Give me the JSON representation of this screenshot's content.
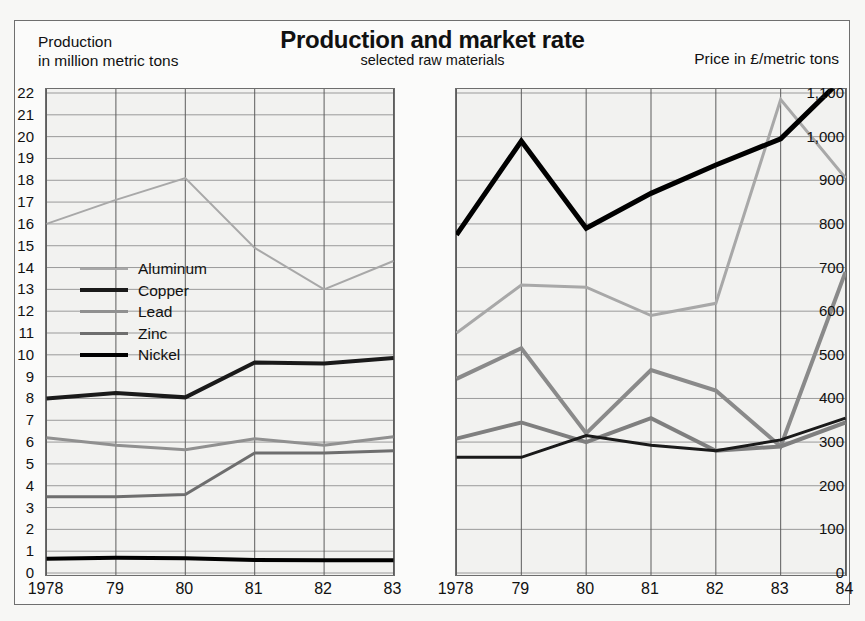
{
  "header": {
    "title": "Production and market rate",
    "subtitle": "selected raw materials",
    "left_caption_line1": "Production",
    "left_caption_line2": "in million metric tons",
    "right_caption": "Price in £/metric tons"
  },
  "legend": {
    "position": "inside-left-panel",
    "entries": [
      {
        "label": "Aluminum",
        "color": "#a8a8a8",
        "width": 2
      },
      {
        "label": "Copper",
        "color": "#1a1a1a",
        "width": 4
      },
      {
        "label": "Lead",
        "color": "#909090",
        "width": 3
      },
      {
        "label": "Zinc",
        "color": "#6e6e6e",
        "width": 3
      },
      {
        "label": "Nickel",
        "color": "#000000",
        "width": 4
      }
    ]
  },
  "chart_data": [
    {
      "id": "production",
      "type": "line",
      "title": "Production",
      "ylabel": "in million metric tons",
      "xlabel": "",
      "categories": [
        "1978",
        "79",
        "80",
        "81",
        "82",
        "83"
      ],
      "x_tick_labels": [
        "1978",
        "79",
        "80",
        "81",
        "82",
        "83"
      ],
      "ylim": [
        0,
        22
      ],
      "ytick_step": 1,
      "y_tick_labels": [
        "0",
        "1",
        "2",
        "3",
        "4",
        "5",
        "6",
        "7",
        "8",
        "9",
        "10",
        "11",
        "12",
        "13",
        "14",
        "15",
        "16",
        "17",
        "18",
        "19",
        "20",
        "21",
        "22"
      ],
      "grid": true,
      "series": [
        {
          "name": "Aluminum",
          "color": "#a8a8a8",
          "width": 2,
          "values": [
            16.0,
            17.1,
            18.1,
            14.9,
            13.0,
            14.3
          ]
        },
        {
          "name": "Copper",
          "color": "#1a1a1a",
          "width": 4,
          "values": [
            8.0,
            8.25,
            8.05,
            9.65,
            9.6,
            9.85
          ]
        },
        {
          "name": "Lead",
          "color": "#909090",
          "width": 3,
          "values": [
            6.2,
            5.85,
            5.65,
            6.15,
            5.85,
            6.25
          ]
        },
        {
          "name": "Zinc",
          "color": "#6e6e6e",
          "width": 3,
          "values": [
            3.5,
            3.5,
            3.6,
            5.5,
            5.5,
            5.6
          ]
        },
        {
          "name": "Nickel",
          "color": "#000000",
          "width": 4,
          "values": [
            0.65,
            0.7,
            0.68,
            0.6,
            0.58,
            0.58
          ]
        }
      ]
    },
    {
      "id": "market-rate",
      "type": "line",
      "title": "market rate",
      "ylabel": "Price in £/metric tons",
      "xlabel": "",
      "categories": [
        "1978",
        "79",
        "80",
        "81",
        "82",
        "83",
        "84"
      ],
      "x_tick_labels": [
        "1978",
        "79",
        "80",
        "81",
        "82",
        "83",
        "84"
      ],
      "ylim": [
        0,
        1100
      ],
      "ytick_step": 100,
      "y_tick_labels": [
        "0",
        "100",
        "200",
        "300",
        "400",
        "500",
        "600",
        "700",
        "800",
        "900",
        "1,000",
        "1,100"
      ],
      "grid": true,
      "series": [
        {
          "name": "Aluminum",
          "color": "#a8a8a8",
          "width": 3,
          "values": [
            550,
            660,
            655,
            590,
            618,
            1085,
            905
          ]
        },
        {
          "name": "Copper",
          "color": "#8a8a8a",
          "width": 4,
          "values": [
            445,
            515,
            320,
            465,
            418,
            290,
            690
          ]
        },
        {
          "name": "Lead",
          "color": "#1a1a1a",
          "width": 3,
          "values": [
            265,
            265,
            315,
            293,
            280,
            305,
            355
          ]
        },
        {
          "name": "Zinc",
          "color": "#7f7f7f",
          "width": 4,
          "values": [
            308,
            345,
            300,
            355,
            280,
            290,
            345
          ]
        },
        {
          "name": "Nickel",
          "color": "#000000",
          "width": 5,
          "values": [
            775,
            990,
            790,
            870,
            935,
            995,
            1140
          ]
        }
      ]
    }
  ]
}
